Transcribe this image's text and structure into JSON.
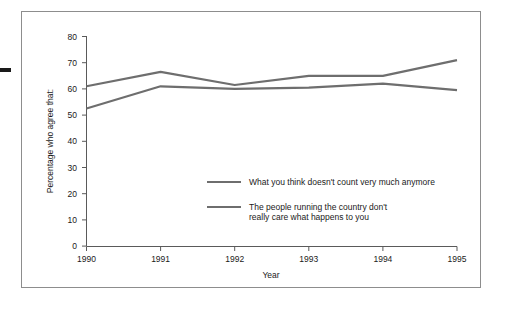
{
  "figure": {
    "background_color": "#ffffff",
    "frame_color": "#8d8d8d",
    "edge_mark_color": "#1a1a1a"
  },
  "chart_data": {
    "type": "line",
    "title": "",
    "xlabel": "Year",
    "ylabel": "Percentage who agree that:",
    "categories": [
      "1990",
      "1991",
      "1992",
      "1993",
      "1994",
      "1995"
    ],
    "x": [
      1990,
      1991,
      1992,
      1993,
      1994,
      1995
    ],
    "xlim": [
      1990,
      1995
    ],
    "ylim": [
      0,
      80
    ],
    "yticks": [
      0,
      10,
      20,
      30,
      40,
      50,
      60,
      70,
      80
    ],
    "ytick_labels": [
      "0",
      "10",
      "20",
      "30",
      "40",
      "50",
      "60",
      "70",
      "80"
    ],
    "xtick_labels": [
      "1990",
      "1991",
      "1992",
      "1993",
      "1994",
      "1995"
    ],
    "grid": false,
    "legend_position": "inside-lower-center",
    "line_color": "#6e6e6e",
    "series": [
      {
        "name": "What you think doesn't count very much anymore",
        "values": [
          61,
          66.5,
          61.5,
          65,
          65,
          71
        ],
        "color": "#6e6e6e"
      },
      {
        "name": "The people running the country don't really care what happens to you",
        "values": [
          52.5,
          61,
          60,
          60.5,
          62,
          59.5
        ],
        "color": "#6e6e6e"
      }
    ]
  },
  "axis": {
    "y_label": "Percentage who agree that:",
    "x_label": "Year",
    "y_ticks": [
      "80",
      "70",
      "60",
      "50",
      "40",
      "30",
      "20",
      "10",
      "0"
    ],
    "x_ticks": [
      "1990",
      "1991",
      "1992",
      "1993",
      "1994",
      "1995"
    ]
  },
  "legend": {
    "entries": [
      {
        "line1": "What you think doesn't count very much anymore",
        "line2": ""
      },
      {
        "line1": "The people running the country don't",
        "line2": "really care what happens to you"
      }
    ]
  }
}
